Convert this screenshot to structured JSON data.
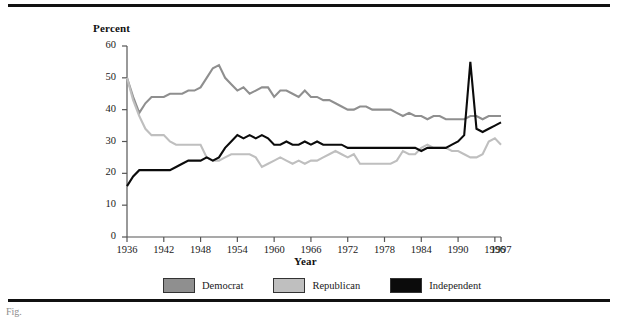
{
  "figure": {
    "caption_text": "Fig.",
    "rule_color": "#111111"
  },
  "legend": {
    "position": "bottom-center",
    "items": [
      {
        "label": "Democrat",
        "color": "#8f8f8f",
        "name": "legend-democrat"
      },
      {
        "label": "Republican",
        "color": "#bfbfbf",
        "name": "legend-republican"
      },
      {
        "label": "Independent",
        "color": "#0b0b0b",
        "name": "legend-independent"
      }
    ]
  },
  "chart_data": {
    "type": "line",
    "title": "",
    "xlabel": "Year",
    "ylabel": "Percent",
    "xlim": [
      1936,
      1997
    ],
    "ylim": [
      0,
      60
    ],
    "grid": false,
    "legend_position": "bottom-center",
    "ytick_labels": [
      "0",
      "10",
      "20",
      "30",
      "40",
      "50",
      "60"
    ],
    "yticks": [
      0,
      10,
      20,
      30,
      40,
      50,
      60
    ],
    "xtick_labels": [
      "1936",
      "1942",
      "1948",
      "1954",
      "1960",
      "1966",
      "1972",
      "1978",
      "1984",
      "1990",
      "1996",
      "1997"
    ],
    "xticks": [
      1936,
      1942,
      1948,
      1954,
      1960,
      1966,
      1972,
      1978,
      1984,
      1990,
      1996,
      1997
    ],
    "x": [
      1936,
      1937,
      1938,
      1939,
      1940,
      1941,
      1942,
      1943,
      1944,
      1945,
      1946,
      1947,
      1948,
      1949,
      1950,
      1951,
      1952,
      1953,
      1954,
      1955,
      1956,
      1957,
      1958,
      1959,
      1960,
      1961,
      1962,
      1963,
      1964,
      1965,
      1966,
      1967,
      1968,
      1969,
      1970,
      1971,
      1972,
      1973,
      1974,
      1975,
      1976,
      1977,
      1978,
      1979,
      1980,
      1981,
      1982,
      1983,
      1984,
      1985,
      1986,
      1987,
      1988,
      1989,
      1990,
      1991,
      1992,
      1993,
      1994,
      1995,
      1996,
      1997
    ],
    "series": [
      {
        "name": "Democrat",
        "color": "#8f8f8f",
        "values": [
          50,
          44,
          39,
          42,
          44,
          44,
          44,
          45,
          45,
          45,
          46,
          46,
          47,
          50,
          53,
          54,
          50,
          48,
          46,
          47,
          45,
          46,
          47,
          47,
          44,
          46,
          46,
          45,
          44,
          46,
          44,
          44,
          43,
          43,
          42,
          41,
          40,
          40,
          41,
          41,
          40,
          40,
          40,
          40,
          39,
          38,
          39,
          38,
          38,
          37,
          38,
          38,
          37,
          37,
          37,
          37,
          38,
          38,
          37,
          38,
          38,
          38
        ]
      },
      {
        "name": "Republican",
        "color": "#bfbfbf",
        "values": [
          50,
          43,
          38,
          34,
          32,
          32,
          32,
          30,
          29,
          29,
          29,
          29,
          29,
          25,
          24,
          24,
          25,
          26,
          26,
          26,
          26,
          25,
          22,
          23,
          24,
          25,
          24,
          23,
          24,
          23,
          24,
          24,
          25,
          26,
          27,
          26,
          25,
          26,
          23,
          23,
          23,
          23,
          23,
          23,
          24,
          27,
          26,
          26,
          28,
          29,
          28,
          28,
          28,
          27,
          27,
          26,
          25,
          25,
          26,
          30,
          31,
          29
        ]
      },
      {
        "name": "Independent",
        "color": "#0b0b0b",
        "values": [
          16,
          19,
          21,
          21,
          21,
          21,
          21,
          21,
          22,
          23,
          24,
          24,
          24,
          25,
          24,
          25,
          28,
          30,
          32,
          31,
          32,
          31,
          32,
          31,
          29,
          29,
          30,
          29,
          29,
          30,
          29,
          30,
          29,
          29,
          29,
          29,
          28,
          28,
          28,
          28,
          28,
          28,
          28,
          28,
          28,
          28,
          28,
          28,
          27,
          28,
          28,
          28,
          28,
          29,
          30,
          32,
          55,
          34,
          33,
          34,
          35,
          36
        ]
      }
    ]
  }
}
